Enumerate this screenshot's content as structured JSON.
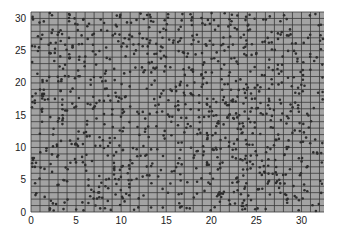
{
  "chart_data": {
    "type": "scatter",
    "title": "",
    "xlabel": "",
    "ylabel": "",
    "xlim": [
      0,
      32.5
    ],
    "ylim": [
      0,
      31
    ],
    "x_ticks": [
      0,
      5,
      10,
      15,
      20,
      25,
      30
    ],
    "y_ticks": [
      0,
      5,
      10,
      15,
      20,
      25,
      30
    ],
    "grid": true,
    "grid_step": 1,
    "legend": null,
    "colors": {
      "background": "#a3a3a3",
      "grid": "#3a3a3a",
      "points": "#2e2e2e"
    },
    "series": [
      {
        "name": "points",
        "count": 1000,
        "distribution": "uniform random over plot area",
        "seed": 7
      }
    ]
  }
}
